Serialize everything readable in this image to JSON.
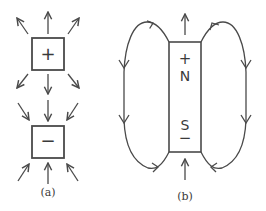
{
  "figure": {
    "stroke_color": "#4a4a4a",
    "background": "#ffffff",
    "panel_a": {
      "label": "(a)",
      "positive_charge": {
        "symbol": "+",
        "field_direction": "outward",
        "arrow_count": 8
      },
      "negative_charge": {
        "symbol": "−",
        "field_direction": "inward",
        "arrow_count": 8
      }
    },
    "panel_b": {
      "label": "(b)",
      "magnet": {
        "top_sign": "+",
        "top_pole": "N",
        "bottom_pole": "S",
        "bottom_sign": "−"
      },
      "field_loops": 2,
      "loop_direction": "out of N (top), around the sides downward, into S (bottom)"
    }
  }
}
